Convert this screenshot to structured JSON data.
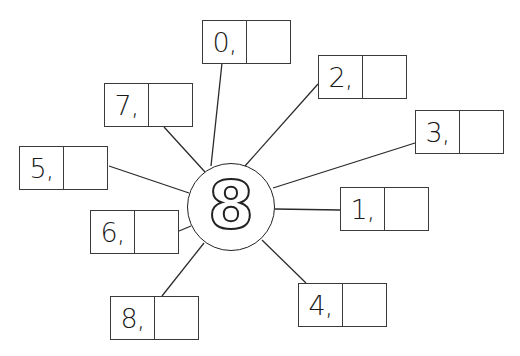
{
  "diagram": {
    "type": "multiplication-wheel",
    "center": {
      "value": "8"
    },
    "colors": {
      "stroke": "#222222",
      "background": "#ffffff"
    },
    "spokes": [
      {
        "label": "0,",
        "answer": ""
      },
      {
        "label": "2,",
        "answer": ""
      },
      {
        "label": "3,",
        "answer": ""
      },
      {
        "label": "1,",
        "answer": ""
      },
      {
        "label": "4,",
        "answer": ""
      },
      {
        "label": "8,",
        "answer": ""
      },
      {
        "label": "6,",
        "answer": ""
      },
      {
        "label": "5,",
        "answer": ""
      },
      {
        "label": "7,",
        "answer": ""
      }
    ]
  }
}
